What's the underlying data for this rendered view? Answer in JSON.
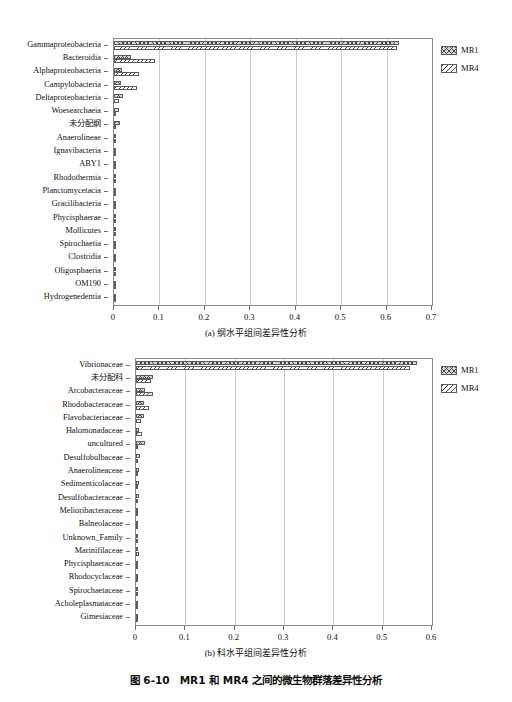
{
  "figure": {
    "caption": "图 6-10　MR1 和 MR4 之间的微生物群落差异性分析"
  },
  "legend": {
    "series": [
      {
        "name": "MR1",
        "pattern": "cross-hatch",
        "color": "#d6d6d6"
      },
      {
        "name": "MR4",
        "pattern": "diagonal-hatch",
        "color": "#ffffff"
      }
    ]
  },
  "chart_data": [
    {
      "type": "bar",
      "id": "panel-a",
      "title": "(a) 纲水平组间差异性分析",
      "orientation": "horizontal",
      "grouped": true,
      "xlabel": "",
      "ylabel": "",
      "xlim": [
        0,
        0.7
      ],
      "xticks": [
        "0",
        "0.1",
        "0.2",
        "0.3",
        "0.4",
        "0.5",
        "0.6",
        "0.7"
      ],
      "xtick_values": [
        0,
        0.1,
        0.2,
        0.3,
        0.4,
        0.5,
        0.6,
        0.7
      ],
      "grid": "vertical",
      "legend_position": "right",
      "categories": [
        "Gammaproteobacteria",
        "Bacteroidia",
        "Alphaproteobacteria",
        "Campylobacteria",
        "Deltaproteobacteria",
        "Woesearchaeia",
        "未分配纲",
        "Anaerolineae",
        "Ignavibacteria",
        "ABY1",
        "Rhodothermia",
        "Planctomycetacia",
        "Gracilibacteria",
        "Phycisphaerae",
        "Mollicutes",
        "Spirochaetia",
        "Clostridia",
        "Oligosphaeria",
        "OM190",
        "Hydrogenedentia"
      ],
      "series": [
        {
          "name": "MR1",
          "values": [
            0.628,
            0.038,
            0.018,
            0.015,
            0.019,
            0.012,
            0.013,
            0.005,
            0.005,
            0.004,
            0.004,
            0.004,
            0.002,
            0.003,
            0.003,
            0.002,
            0.001,
            0.001,
            0.001,
            0.001
          ]
        },
        {
          "name": "MR4",
          "values": [
            0.622,
            0.09,
            0.055,
            0.05,
            0.01,
            0.004,
            0.003,
            0.005,
            0.004,
            0.002,
            0.003,
            0.002,
            0.003,
            0.002,
            0.002,
            0.001,
            0.0,
            0.0,
            0.0,
            0.0
          ]
        }
      ]
    },
    {
      "type": "bar",
      "id": "panel-b",
      "title": "(b) 科水平组间差异性分析",
      "orientation": "horizontal",
      "grouped": true,
      "xlabel": "",
      "ylabel": "",
      "xlim": [
        0,
        0.6
      ],
      "xticks": [
        "0",
        "0.1",
        "0.2",
        "0.3",
        "0.4",
        "0.5",
        "0.6"
      ],
      "xtick_values": [
        0,
        0.1,
        0.2,
        0.3,
        0.4,
        0.5,
        0.6
      ],
      "grid": "vertical",
      "legend_position": "right",
      "categories": [
        "Vibrionaceae",
        "未分配科",
        "Arcobacteraceae",
        "Rhodobacteraceae",
        "Flavobacteriaceae",
        "Halomonadaceae",
        "uncultured",
        "Desulfobulbaceae",
        "Anaerolineaceae",
        "Sedimenticolaceae",
        "Desulfobacteraceae",
        "Melioribacteraceae",
        "Balneolaceae",
        "Unknown_Family",
        "Marinifilaceae",
        "Phycisphaeraceae",
        "Rhodocyclaceae",
        "Spirochaetaceae",
        "Acholeplasmataceae",
        "Gimesiaceae"
      ],
      "series": [
        {
          "name": "MR1",
          "values": [
            0.57,
            0.035,
            0.018,
            0.017,
            0.016,
            0.006,
            0.018,
            0.009,
            0.006,
            0.006,
            0.006,
            0.004,
            0.003,
            0.005,
            0.004,
            0.002,
            0.002,
            0.002,
            0.003,
            0.001
          ]
        },
        {
          "name": "MR4",
          "values": [
            0.555,
            0.03,
            0.034,
            0.027,
            0.011,
            0.012,
            0.003,
            0.003,
            0.004,
            0.002,
            0.003,
            0.005,
            0.004,
            0.004,
            0.006,
            0.004,
            0.002,
            0.002,
            0.004,
            0.001
          ]
        }
      ]
    }
  ]
}
